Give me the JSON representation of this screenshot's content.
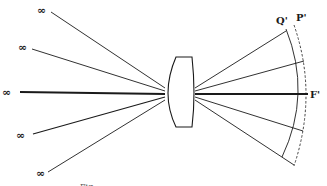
{
  "diagram": {
    "type": "optics-lens-field-curvature",
    "colors": {
      "ink": "#1a1a1a",
      "background": "#ffffff"
    },
    "sources": [
      {
        "label": "∞",
        "x": 45,
        "y": 10
      },
      {
        "label": "∞",
        "x": 24,
        "y": 47
      },
      {
        "label": "∞",
        "x": 6,
        "y": 92
      },
      {
        "label": "∞",
        "x": 20,
        "y": 136
      },
      {
        "label": "∞",
        "x": 40,
        "y": 173
      }
    ],
    "lens": {
      "name": "converging lens"
    },
    "image_points": {
      "f_prime": "F'",
      "p_prime": "P'",
      "q_prime": "Q'"
    },
    "caption": "Fig. ..."
  }
}
